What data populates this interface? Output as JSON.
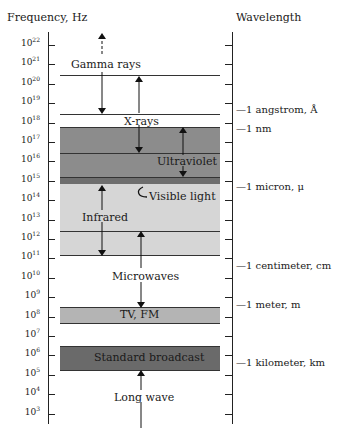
{
  "headers": {
    "frequency": "Frequency, Hz",
    "wavelength": "Wavelength"
  },
  "frequency_ticks": [
    {
      "base": "10",
      "exp": "22"
    },
    {
      "base": "10",
      "exp": "21"
    },
    {
      "base": "10",
      "exp": "20"
    },
    {
      "base": "10",
      "exp": "19"
    },
    {
      "base": "10",
      "exp": "18"
    },
    {
      "base": "10",
      "exp": "17"
    },
    {
      "base": "10",
      "exp": "16"
    },
    {
      "base": "10",
      "exp": "15"
    },
    {
      "base": "10",
      "exp": "14"
    },
    {
      "base": "10",
      "exp": "13"
    },
    {
      "base": "10",
      "exp": "12"
    },
    {
      "base": "10",
      "exp": "11"
    },
    {
      "base": "10",
      "exp": "10"
    },
    {
      "base": "10",
      "exp": "9"
    },
    {
      "base": "10",
      "exp": "8"
    },
    {
      "base": "10",
      "exp": "7"
    },
    {
      "base": "10",
      "exp": "6"
    },
    {
      "base": "10",
      "exp": "5"
    },
    {
      "base": "10",
      "exp": "4"
    },
    {
      "base": "10",
      "exp": "3"
    }
  ],
  "bands": {
    "gamma": "Gamma rays",
    "xray": "X-rays",
    "uv": "Ultraviolet",
    "visible": "Visible light",
    "infrared": "Infrared",
    "microwaves": "Microwaves",
    "tvfm": "TV, FM",
    "broadcast": "Standard broadcast",
    "longwave": "Long wave"
  },
  "wavelength_labels": {
    "angstrom": "—1 angstrom, Å",
    "nm": "—1 nm",
    "micron": "—1 micron, μ",
    "centimeter": "—1 centimeter, cm",
    "meter": "—1 meter, m",
    "kilometer": "—1 kilometer, km"
  },
  "colors": {
    "uv_band": "#8c8c8c",
    "visible_strip": "#6e6e6e",
    "infrared_band": "#d6d6d6",
    "tvfm_band": "#b4b4b4",
    "broadcast_band": "#6a6a6a"
  }
}
